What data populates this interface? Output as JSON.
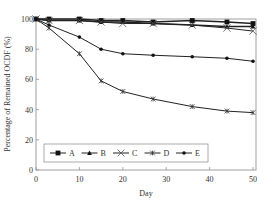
{
  "chart_data": {
    "type": "line",
    "title": "",
    "xlabel": "Day",
    "ylabel": "Percentage of Remained OCDF (%)",
    "xlim": [
      0,
      50
    ],
    "ylim": [
      0,
      100
    ],
    "xticks": [
      0,
      10,
      20,
      30,
      40,
      50
    ],
    "yticks": [
      0,
      20,
      40,
      60,
      80,
      100
    ],
    "grid": false,
    "legend_position": "lower-left inside",
    "x": [
      0,
      3,
      10,
      15,
      20,
      27,
      36,
      44,
      50
    ],
    "series": [
      {
        "name": "A",
        "marker": "square",
        "values": [
          100,
          100,
          100,
          99,
          99,
          98,
          99,
          98,
          97
        ]
      },
      {
        "name": "B",
        "marker": "triangle",
        "values": [
          100,
          99,
          99,
          98,
          98,
          97,
          96,
          95,
          95
        ]
      },
      {
        "name": "C",
        "marker": "x",
        "values": [
          100,
          99,
          99,
          98,
          97,
          97,
          96,
          94,
          92
        ]
      },
      {
        "name": "D",
        "marker": "asterisk",
        "values": [
          100,
          94,
          77,
          59,
          52,
          47,
          42,
          39,
          38
        ]
      },
      {
        "name": "E",
        "marker": "circle",
        "values": [
          100,
          96,
          88,
          80,
          77,
          76,
          75,
          74,
          72
        ]
      }
    ]
  }
}
